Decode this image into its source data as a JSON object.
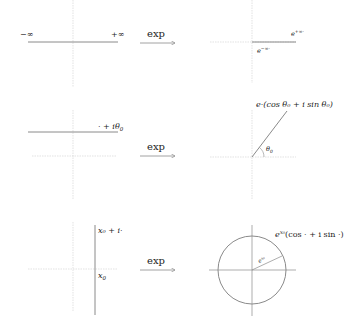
{
  "map_label": "exp",
  "colors": {
    "axis": "#cfcfcf",
    "line": "#8a8a8a",
    "text": "#222222"
  },
  "rows": [
    {
      "id": "real-line",
      "left": {
        "neg_inf_label": "−∞",
        "pos_inf_label": "+∞"
      },
      "right": {
        "top_label_base": "e",
        "top_label_sup": "+∞·",
        "bottom_label_base": "e",
        "bottom_label_sup": "−∞·"
      }
    },
    {
      "id": "horizontal-line",
      "left": {
        "line_label": "· + iθ",
        "line_label_sub": "0"
      },
      "right": {
        "ray_label": "e·(cos θ₀ + i sin θ₀)",
        "angle_label": "θ",
        "angle_label_sub": "0"
      }
    },
    {
      "id": "vertical-line",
      "left": {
        "top_label": "x₀ + i·",
        "bottom_label": "x",
        "bottom_label_sub": "0"
      },
      "right": {
        "circle_label_base": "e",
        "circle_label_sup": "x₀",
        "circle_label_rest": "(cos · + i sin ·)",
        "radius_label_base": "e",
        "radius_label_sup": "x₀"
      }
    }
  ]
}
